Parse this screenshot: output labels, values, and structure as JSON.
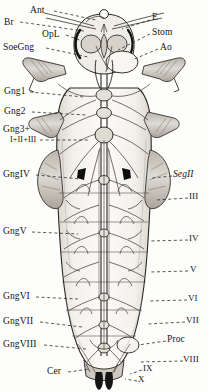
{
  "figure": {
    "type": "anatomical-diagram",
    "background_color": "#fdfdfc",
    "ink_color": "#1a1a1a"
  },
  "labels_left": [
    {
      "id": "br",
      "text": "Br",
      "x": 4,
      "y": 18,
      "leader_to_x": 86,
      "leader_to_y": 30
    },
    {
      "id": "ant",
      "text": "Ant",
      "x": 30,
      "y": 7,
      "leader_to_x": 95,
      "leader_to_y": 17
    },
    {
      "id": "opl",
      "text": "OpL",
      "x": 42,
      "y": 31,
      "leader_to_x": 79,
      "leader_to_y": 38
    },
    {
      "id": "soegng",
      "text": "SoeGng",
      "x": 4,
      "y": 44,
      "leader_to_x": 89,
      "leader_to_y": 55
    },
    {
      "id": "gng1",
      "text": "Gng1",
      "x": 4,
      "y": 88,
      "leader_to_x": 84,
      "leader_to_y": 95
    },
    {
      "id": "gng2",
      "text": "Gng2",
      "x": 4,
      "y": 108,
      "leader_to_x": 86,
      "leader_to_y": 113
    },
    {
      "id": "gng3",
      "text": "Gng3+",
      "x": 4,
      "y": 126,
      "leader_to_x": 88,
      "leader_to_y": 135
    },
    {
      "id": "gng3sub",
      "text": "I+II+III",
      "x": 10,
      "y": 136,
      "leader_to_x": 0,
      "leader_to_y": 0
    },
    {
      "id": "gng4",
      "text": "GngIV",
      "x": 4,
      "y": 171,
      "leader_to_x": 80,
      "leader_to_y": 178
    },
    {
      "id": "gng5",
      "text": "GngV",
      "x": 4,
      "y": 228,
      "leader_to_x": 80,
      "leader_to_y": 233
    },
    {
      "id": "gng6",
      "text": "GngVI",
      "x": 4,
      "y": 293,
      "leader_to_x": 80,
      "leader_to_y": 297
    },
    {
      "id": "gng7",
      "text": "GngVII",
      "x": 4,
      "y": 318,
      "leader_to_x": 82,
      "leader_to_y": 325
    },
    {
      "id": "gng8",
      "text": "GngVIII",
      "x": 4,
      "y": 341,
      "leader_to_x": 84,
      "leader_to_y": 348
    },
    {
      "id": "cer",
      "text": "Cer",
      "x": 50,
      "y": 370,
      "leader_to_x": 88,
      "leader_to_y": 368
    }
  ],
  "labels_right": [
    {
      "id": "e",
      "text": "E",
      "x": 152,
      "y": 15,
      "leader_to_x": 120,
      "leader_to_y": 28
    },
    {
      "id": "stom",
      "text": "Stom",
      "x": 152,
      "y": 29,
      "leader_to_x": 116,
      "leader_to_y": 48
    },
    {
      "id": "ao",
      "text": "Ao",
      "x": 160,
      "y": 44,
      "leader_to_x": 129,
      "leader_to_y": 60
    },
    {
      "id": "segII",
      "text": "SegII",
      "x": 175,
      "y": 172,
      "leader_to_x": 151,
      "leader_to_y": 176,
      "italic": true
    },
    {
      "id": "segIII",
      "text": "III",
      "x": 190,
      "y": 194,
      "leader_to_x": 156,
      "leader_to_y": 198
    },
    {
      "id": "segIV",
      "text": "IV",
      "x": 190,
      "y": 236,
      "leader_to_x": 150,
      "leader_to_y": 240
    },
    {
      "id": "segV",
      "text": "V",
      "x": 190,
      "y": 267,
      "leader_to_x": 150,
      "leader_to_y": 271
    },
    {
      "id": "segVI",
      "text": "VI",
      "x": 189,
      "y": 296,
      "leader_to_x": 150,
      "leader_to_y": 300
    },
    {
      "id": "segVII",
      "text": "VII",
      "x": 187,
      "y": 318,
      "leader_to_x": 148,
      "leader_to_y": 322
    },
    {
      "id": "proc",
      "text": "Proc",
      "x": 168,
      "y": 337,
      "leader_to_x": 137,
      "leader_to_y": 343
    },
    {
      "id": "segVIII",
      "text": "VIII",
      "x": 185,
      "y": 357,
      "leader_to_x": 140,
      "leader_to_y": 360
    },
    {
      "id": "segIX",
      "text": "IX",
      "x": 143,
      "y": 366,
      "leader_to_x": 129,
      "leader_to_y": 372
    },
    {
      "id": "segX",
      "text": "X",
      "x": 138,
      "y": 378,
      "leader_to_x": 124,
      "leader_to_y": 378
    }
  ],
  "legend_meaning": {
    "Br": "Brain",
    "Ant": "Antennal nerve",
    "OpL": "Optic lobe",
    "SoeGng": "Suboesophageal ganglion",
    "E": "Eye",
    "Stom": "Stomodaeum",
    "Ao": "Aorta",
    "Gng": "Ganglion",
    "Seg": "Segment",
    "Proc": "Proctodaeum",
    "Cer": "Cercus"
  }
}
